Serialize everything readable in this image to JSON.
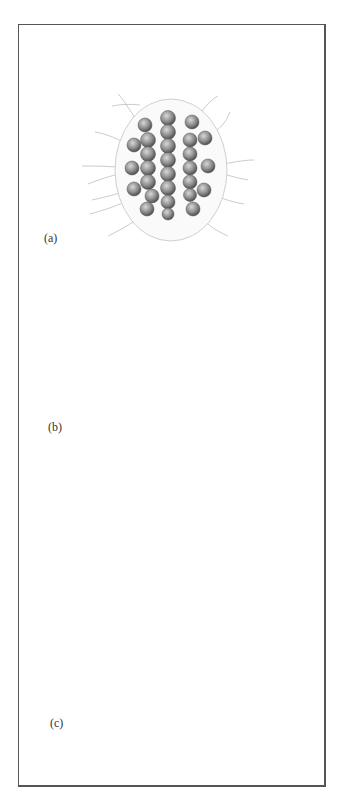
{
  "figure": {
    "panels": [
      {
        "id": "a",
        "label": "(a)",
        "description": "oval colony of ciliated cells arranged in columns"
      },
      {
        "id": "b",
        "label": "(b)",
        "description": "clustered colony of rounded cells with filaments"
      },
      {
        "id": "c",
        "label": "(c)",
        "description": "spherical colony of radially arranged flagellated cells"
      }
    ]
  },
  "colors": {
    "frame": "#555555",
    "ink": "#4a4a4a",
    "shade": "#8a8a8a",
    "background": "#ffffff"
  }
}
